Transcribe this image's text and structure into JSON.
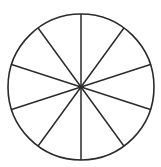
{
  "diagram": {
    "shape": "circle",
    "divisions": 10,
    "slice_angle_deg": 36,
    "start_angle_deg": 0,
    "center": [
      81,
      87
    ],
    "radius": 73,
    "stroke_color": "#2b2b2b",
    "fill_color": "#ffffff"
  }
}
